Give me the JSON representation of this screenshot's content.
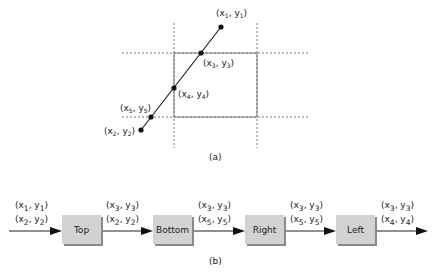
{
  "part_a": {
    "caption": "(a)",
    "points": [
      {
        "id": "p1",
        "label": "(x1, y1)",
        "x": 221,
        "y": 27
      },
      {
        "id": "p3",
        "label": "(x3, y3)",
        "x": 201,
        "y": 53
      },
      {
        "id": "p4",
        "label": "(x4, y4)",
        "x": 174,
        "y": 88
      },
      {
        "id": "p5",
        "label": "(x5, y5)",
        "x": 151,
        "y": 117
      },
      {
        "id": "p2",
        "label": "(x2, y2)",
        "x": 141,
        "y": 130
      }
    ],
    "clip_window": {
      "left": 174,
      "right": 257,
      "top": 53,
      "bottom": 117
    }
  },
  "part_b": {
    "caption": "(b)",
    "stages": [
      {
        "name": "Top"
      },
      {
        "name": "Bottom"
      },
      {
        "name": "Right"
      },
      {
        "name": "Left"
      }
    ],
    "edge_labels": [
      [
        "(x1, y1)",
        "(x2, y2)"
      ],
      [
        "(x3, y3)",
        "(x2, y2)"
      ],
      [
        "(x3, y3)",
        "(x5, y5)"
      ],
      [
        "(x3, y3)",
        "(x5, y5)"
      ],
      [
        "(x3, y3)",
        "(x4, y4)"
      ]
    ]
  }
}
